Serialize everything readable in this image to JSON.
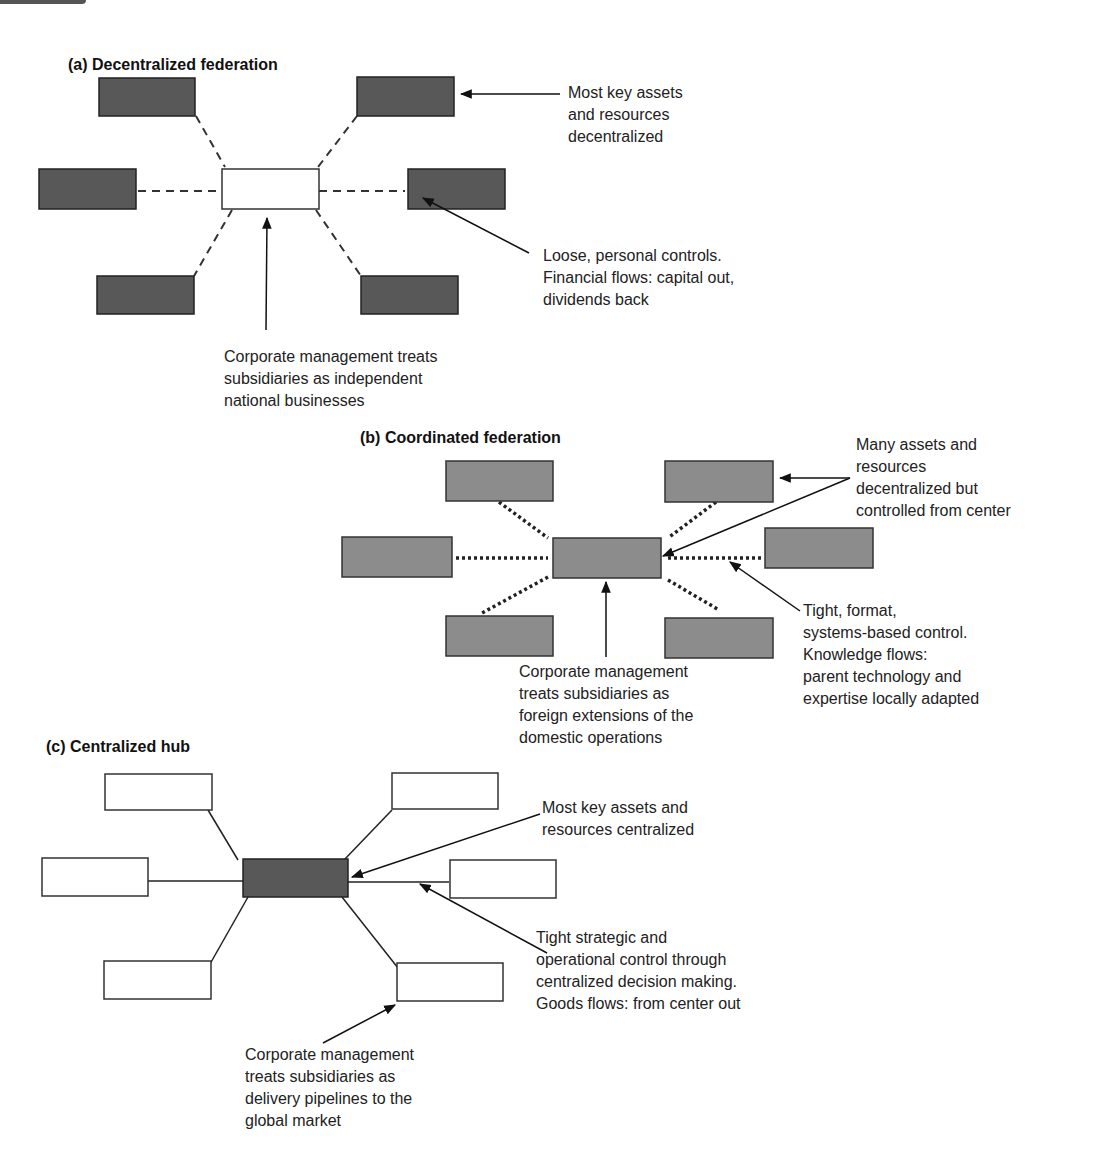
{
  "panels": [
    {
      "id": "a",
      "title": "(a) Decentralized federation",
      "style": {
        "node_fill": "#585858",
        "hub_fill": "#ffffff",
        "connector": "dashed"
      },
      "annotations": [
        {
          "id": "assets",
          "text": "Most key assets\nand resources\ndecentralized"
        },
        {
          "id": "controls",
          "text": "Loose, personal controls.\nFinancial flows: capital out,\ndividends back"
        },
        {
          "id": "management",
          "text": "Corporate management treats\nsubsidiaries as independent\nnational businesses"
        }
      ]
    },
    {
      "id": "b",
      "title": "(b) Coordinated federation",
      "style": {
        "node_fill": "#8c8c8c",
        "hub_fill": "#8c8c8c",
        "connector": "dotted"
      },
      "annotations": [
        {
          "id": "assets",
          "text": "Many assets and\nresources\ndecentralized but\ncontrolled from center"
        },
        {
          "id": "controls",
          "text": "Tight, format,\nsystems-based control.\nKnowledge flows:\nparent technology and\nexpertise locally adapted"
        },
        {
          "id": "management",
          "text": "Corporate management\ntreats subsidiaries as\nforeign extensions of the\ndomestic operations"
        }
      ]
    },
    {
      "id": "c",
      "title": "(c) Centralized hub",
      "style": {
        "node_fill": "#ffffff",
        "hub_fill": "#585858",
        "connector": "solid"
      },
      "annotations": [
        {
          "id": "assets",
          "text": "Most key assets and\nresources centralized"
        },
        {
          "id": "controls",
          "text": "Tight strategic and\noperational control through\ncentralized decision making.\nGoods flows: from center out"
        },
        {
          "id": "management",
          "text": "Corporate management\ntreats subsidiaries as\ndelivery pipelines to the\nglobal market"
        }
      ]
    }
  ]
}
